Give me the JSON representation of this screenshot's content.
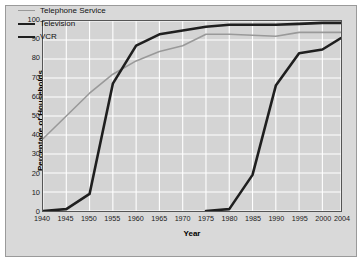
{
  "figure": {
    "background_color": "#d9d9d9",
    "plot_background_color": "#d4d4d4",
    "grid_color": "#ffffff",
    "axis_color": "#555555"
  },
  "legend": {
    "position": "top-left-inside",
    "entries": [
      {
        "label": "Telephone Service",
        "color": "#999999",
        "width": 1.6
      },
      {
        "label": "Television",
        "color": "#1f1f1f",
        "width": 2.6
      },
      {
        "label": "VCR",
        "color": "#1f1f1f",
        "width": 2.6
      }
    ]
  },
  "chart_data": {
    "type": "line",
    "title": "",
    "xlabel": "Year",
    "ylabel": "Percentage of Households",
    "xlim": [
      1940,
      2004
    ],
    "ylim": [
      0,
      100
    ],
    "grid": true,
    "legend_position": "upper left",
    "x_ticks": [
      1940,
      1945,
      1950,
      1955,
      1960,
      1965,
      1970,
      1975,
      1980,
      1985,
      1990,
      1995,
      2000,
      2004
    ],
    "x_tick_labels": [
      "1940",
      "1945",
      "1950",
      "1955",
      "1960",
      "1965",
      "1970",
      "1975",
      "1980",
      "1985",
      "1990",
      "1995",
      "2000",
      "2004"
    ],
    "y_ticks": [
      0,
      10,
      20,
      30,
      40,
      50,
      60,
      70,
      80,
      90,
      100
    ],
    "y_tick_labels": [
      "0",
      "10",
      "20",
      "30",
      "40",
      "50",
      "60",
      "70",
      "80",
      "90",
      "100"
    ],
    "series": [
      {
        "name": "Telephone Service",
        "color": "#999999",
        "line_width": 1.6,
        "x": [
          1940,
          1945,
          1950,
          1955,
          1960,
          1965,
          1970,
          1975,
          1980,
          1985,
          1990,
          1995,
          2000,
          2004
        ],
        "values": [
          38,
          50,
          62,
          72,
          79,
          84,
          87,
          93,
          93,
          92.5,
          92,
          94,
          94,
          94
        ]
      },
      {
        "name": "Television",
        "color": "#1f1f1f",
        "line_width": 2.6,
        "x": [
          1940,
          1945,
          1950,
          1955,
          1960,
          1965,
          1970,
          1975,
          1980,
          1985,
          1990,
          1995,
          2000,
          2004
        ],
        "values": [
          0,
          1,
          9,
          67,
          87,
          93,
          95,
          97,
          98,
          98,
          98,
          98.5,
          99,
          99
        ]
      },
      {
        "name": "VCR",
        "color": "#1f1f1f",
        "line_width": 2.6,
        "x": [
          1975,
          1980,
          1985,
          1990,
          1995,
          2000,
          2004
        ],
        "values": [
          0,
          1,
          19,
          66,
          83,
          85,
          91
        ]
      }
    ]
  }
}
